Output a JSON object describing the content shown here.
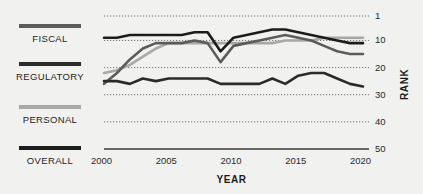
{
  "chart_data": {
    "type": "line",
    "title": "",
    "xlabel": "YEAR",
    "ylabel": "RANK",
    "xlim": [
      2000,
      2020
    ],
    "ylim": [
      1,
      50
    ],
    "y_inverted": true,
    "grid": true,
    "grid_style": "dotted",
    "legend_position": "left",
    "x_ticks": [
      "2000",
      "2005",
      "2010",
      "2015",
      "2020"
    ],
    "x_tick_values": [
      2000,
      2005,
      2010,
      2015,
      2020
    ],
    "y_ticks": [
      "1",
      "10",
      "20",
      "30",
      "40",
      "50"
    ],
    "y_tick_values": [
      1,
      10,
      20,
      30,
      40,
      50
    ],
    "x": [
      2000,
      2001,
      2002,
      2003,
      2004,
      2005,
      2006,
      2007,
      2008,
      2009,
      2010,
      2011,
      2012,
      2013,
      2014,
      2015,
      2016,
      2017,
      2018,
      2019,
      2020
    ],
    "series": [
      {
        "name": "FISCAL",
        "color": "#5c5c5c",
        "values": [
          26,
          22,
          17,
          13,
          11,
          11,
          11,
          10,
          11,
          18,
          12,
          11,
          10,
          9,
          8,
          9,
          10,
          12,
          14,
          15,
          15
        ]
      },
      {
        "name": "REGULATORY",
        "color": "#2b2b2b",
        "values": [
          25,
          25,
          26,
          24,
          25,
          24,
          24,
          24,
          24,
          26,
          26,
          26,
          26,
          24,
          26,
          23,
          22,
          22,
          24,
          26,
          27
        ]
      },
      {
        "name": "PERSONAL",
        "color": "#a8a8a8",
        "values": [
          22,
          21,
          19,
          16,
          13,
          11,
          11,
          11,
          11,
          11,
          11,
          11,
          11,
          11,
          10,
          10,
          10,
          9,
          9,
          9,
          9
        ]
      },
      {
        "name": "OVERALL",
        "color": "#1c1c1c",
        "values": [
          9,
          9,
          8,
          8,
          8,
          8,
          8,
          7,
          7,
          14,
          9,
          8,
          7,
          6,
          6,
          7,
          8,
          9,
          10,
          11,
          11
        ]
      }
    ]
  },
  "legend": {
    "items": [
      {
        "label": "FISCAL",
        "color": "#5c5c5c"
      },
      {
        "label": "REGULATORY",
        "color": "#2b2b2b"
      },
      {
        "label": "PERSONAL",
        "color": "#a8a8a8"
      },
      {
        "label": "OVERALL",
        "color": "#1c1c1c"
      }
    ]
  },
  "axes": {
    "x_title": "YEAR",
    "y_title": "RANK",
    "x_tick_labels": [
      "2000",
      "2005",
      "2010",
      "2015",
      "2020"
    ],
    "y_tick_labels": [
      "1",
      "10",
      "20",
      "30",
      "40",
      "50"
    ]
  },
  "colors": {
    "background": "#f1f1ef",
    "axis": "#3a3a3a",
    "grid": "#6f6f6f",
    "text": "#252525"
  }
}
